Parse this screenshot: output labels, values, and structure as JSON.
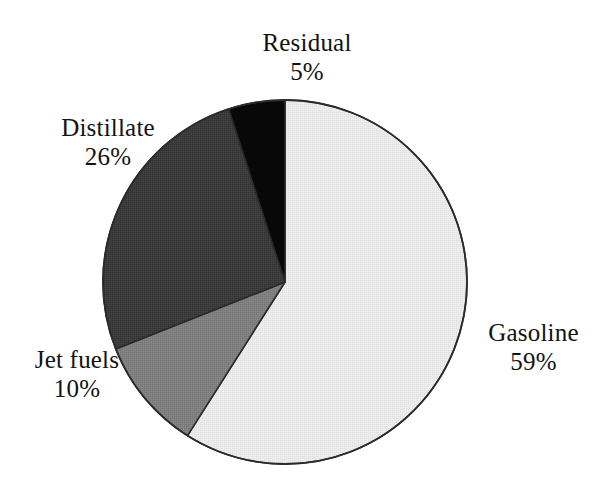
{
  "chart_data": {
    "type": "pie",
    "title": "",
    "subtitle": "",
    "xlabel": "",
    "ylabel": "",
    "legend_position": "none",
    "grid": false,
    "labels_outside": true,
    "start_angle_deg": 0,
    "direction": "clockwise",
    "categories": [
      "Gasoline",
      "Jet fuels",
      "Distillate",
      "Residual"
    ],
    "values": [
      59,
      10,
      26,
      5
    ],
    "unit": "%",
    "slices": [
      {
        "label": "Gasoline",
        "value": 59,
        "value_text": "59%",
        "color": "#e9e9e9",
        "start_deg": 0,
        "end_deg": 212.4
      },
      {
        "label": "Jet fuels",
        "value": 10,
        "value_text": "10%",
        "color": "#7f7f7f",
        "start_deg": 212.4,
        "end_deg": 248.4
      },
      {
        "label": "Distillate",
        "value": 26,
        "value_text": "26%",
        "color": "#3b3b3b",
        "start_deg": 248.4,
        "end_deg": 342.0
      },
      {
        "label": "Residual",
        "value": 5,
        "value_text": "5%",
        "color": "#080808",
        "start_deg": 342.0,
        "end_deg": 360.0
      }
    ]
  },
  "chart": {
    "outline_color": "#2b2b2b",
    "background_color": "#ffffff",
    "center_x": 285,
    "center_y": 282,
    "radius": 182
  },
  "labels": {
    "gasoline": {
      "category": "Gasoline",
      "value_text": "59%"
    },
    "jetfuels": {
      "category": "Jet fuels",
      "value_text": "10%"
    },
    "distillate": {
      "category": "Distillate",
      "value_text": "26%"
    },
    "residual": {
      "category": "Residual",
      "value_text": "5%"
    }
  }
}
